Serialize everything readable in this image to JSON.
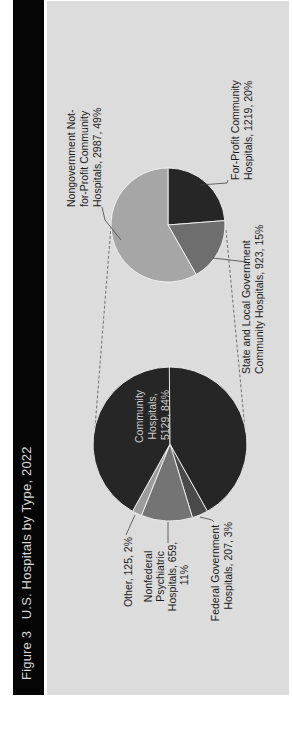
{
  "figure": {
    "title": "Figure 3   U.S. Hospitals by Type, 2022",
    "colors": {
      "title_bar": "#050505",
      "panel": "#dcdcdc",
      "community": "#262626",
      "nonfederal_psychiatric": "#747474",
      "federal": "#4a4a4a",
      "other": "#9c9c9c",
      "for_profit": "#262626",
      "state_local": "#6e6e6e",
      "nongovernment": "#a6a6a6"
    }
  },
  "labels": {
    "community": [
      "Community",
      "Hospitals,",
      "5129, 84%"
    ],
    "other": [
      "Other, 125, 2%"
    ],
    "psychiatric": [
      "Nonfederal",
      "Psychiatric",
      "Hospitals, 659,",
      "11%"
    ],
    "federal": [
      "Federal Government",
      "Hospitals, 207, 3%"
    ],
    "nongovernment": [
      "Nongovernment Not-",
      "for-Profit Community",
      "Hospitals, 2987, 49%"
    ],
    "for_profit": [
      "For-Profit Community",
      "Hospitals, 1219, 20%"
    ],
    "state_local": [
      "State and Local Government",
      "Community Hospitals, 923, 15%"
    ]
  },
  "chart_data": {
    "type": "pie",
    "title": "U.S. Hospitals by Type, 2022",
    "subtitle": "Figure 3",
    "orientation": "rotated 90° counterclockwise (pie-of-pie)",
    "main_pie": {
      "categories": [
        "Community Hospitals",
        "Federal Government Hospitals",
        "Nonfederal Psychiatric Hospitals",
        "Other"
      ],
      "values": [
        5129,
        207,
        659,
        125
      ],
      "percents": [
        84,
        3,
        11,
        2
      ]
    },
    "breakdown_pie": {
      "parent": "Community Hospitals",
      "categories": [
        "For-Profit Community Hospitals",
        "State and Local Government Community Hospitals",
        "Nongovernment Not-for-Profit Community Hospitals"
      ],
      "values": [
        1219,
        923,
        2987
      ],
      "percents": [
        20,
        15,
        49
      ]
    }
  }
}
